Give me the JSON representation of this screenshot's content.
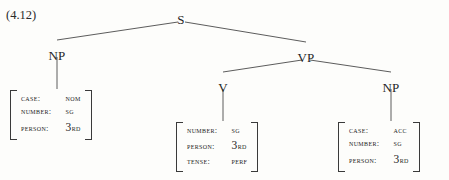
{
  "figure": {
    "example_number": "(4.12)",
    "caption": ""
  },
  "tree": {
    "nodes": [
      {
        "id": "s",
        "label": "S",
        "x": 181,
        "y": 12
      },
      {
        "id": "np1",
        "label": "NP",
        "x": 57,
        "y": 48
      },
      {
        "id": "vp",
        "label": "VP",
        "x": 306,
        "y": 50
      },
      {
        "id": "v",
        "label": "V",
        "x": 223,
        "y": 80
      },
      {
        "id": "np2",
        "label": "NP",
        "x": 391,
        "y": 80
      }
    ],
    "edges": [
      {
        "from": "s",
        "to": "np1",
        "x1": 178,
        "y1": 22,
        "x2": 57,
        "y2": 40
      },
      {
        "from": "s",
        "to": "vp",
        "x1": 185,
        "y1": 22,
        "x2": 306,
        "y2": 42
      },
      {
        "from": "vp",
        "to": "v",
        "x1": 302,
        "y1": 60,
        "x2": 223,
        "y2": 72
      },
      {
        "from": "vp",
        "to": "np2",
        "x1": 310,
        "y1": 60,
        "x2": 391,
        "y2": 72
      },
      {
        "from": "np1",
        "to": "m1",
        "x1": 57,
        "y1": 57,
        "x2": 57,
        "y2": 89
      },
      {
        "from": "v",
        "to": "m2",
        "x1": 223,
        "y1": 89,
        "x2": 223,
        "y2": 121
      },
      {
        "from": "np2",
        "to": "m3",
        "x1": 391,
        "y1": 89,
        "x2": 391,
        "y2": 121
      }
    ]
  },
  "matrices": [
    {
      "id": "m1",
      "owner": "np1",
      "x": 10,
      "y": 90,
      "features": [
        {
          "attr": "Case:",
          "value": "Nom",
          "ordinal": false
        },
        {
          "attr": "Number:",
          "value": "Sg",
          "ordinal": false
        },
        {
          "attr": "Person:",
          "value": "3rd",
          "ordinal": true,
          "ordinal_digit": "3",
          "ordinal_suffix": "rd"
        }
      ]
    },
    {
      "id": "m2",
      "owner": "v",
      "x": 176,
      "y": 122,
      "features": [
        {
          "attr": "Number:",
          "value": "Sg",
          "ordinal": false
        },
        {
          "attr": "Person:",
          "value": "3rd",
          "ordinal": true,
          "ordinal_digit": "3",
          "ordinal_suffix": "rd"
        },
        {
          "attr": "Tense:",
          "value": "Perf",
          "ordinal": false
        }
      ]
    },
    {
      "id": "m3",
      "owner": "np2",
      "x": 338,
      "y": 122,
      "features": [
        {
          "attr": "Case:",
          "value": "Acc",
          "ordinal": false
        },
        {
          "attr": "Number:",
          "value": "Sg",
          "ordinal": false
        },
        {
          "attr": "Person:",
          "value": "3rd",
          "ordinal": true,
          "ordinal_digit": "3",
          "ordinal_suffix": "rd"
        }
      ]
    }
  ],
  "colors": {
    "background": "#fdfdfb",
    "ink": "#262626",
    "line": "#4a4a4a"
  }
}
